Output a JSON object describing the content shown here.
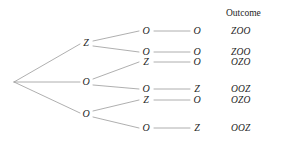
{
  "figure": {
    "type": "probability-tree-diagram",
    "line_color": "#9a9a9a",
    "text_color": "#1e1e1e",
    "background": "#ffffff"
  },
  "header": {
    "outcome_label": "Outcome"
  },
  "root": {
    "label": "",
    "x": 12,
    "y": 82
  },
  "level1": [
    {
      "id": "l1-0",
      "label": "Z",
      "x": 86,
      "y": 43
    },
    {
      "id": "l1-1",
      "label": "O",
      "x": 86,
      "y": 82
    },
    {
      "id": "l1-2",
      "label": "O",
      "x": 86,
      "y": 114
    }
  ],
  "level2": [
    {
      "id": "l2-0",
      "label": "O",
      "x": 146,
      "y": 31,
      "parent": "l1-0"
    },
    {
      "id": "l2-1",
      "label": "O",
      "x": 146,
      "y": 52,
      "parent": "l1-0"
    },
    {
      "id": "l2-2",
      "label": "Z",
      "x": 146,
      "y": 62,
      "parent": "l1-1"
    },
    {
      "id": "l2-3",
      "label": "O",
      "x": 146,
      "y": 89,
      "parent": "l1-1"
    },
    {
      "id": "l2-4",
      "label": "Z",
      "x": 146,
      "y": 100,
      "parent": "l1-2"
    },
    {
      "id": "l2-5",
      "label": "O",
      "x": 146,
      "y": 128,
      "parent": "l1-2"
    }
  ],
  "level3": [
    {
      "id": "l3-0",
      "label": "O",
      "x": 197,
      "y": 31,
      "parent": "l2-0"
    },
    {
      "id": "l3-1",
      "label": "O",
      "x": 197,
      "y": 52,
      "parent": "l2-1"
    },
    {
      "id": "l3-2",
      "label": "O",
      "x": 197,
      "y": 62,
      "parent": "l2-2"
    },
    {
      "id": "l3-3",
      "label": "Z",
      "x": 197,
      "y": 89,
      "parent": "l2-3"
    },
    {
      "id": "l3-4",
      "label": "O",
      "x": 197,
      "y": 100,
      "parent": "l2-4"
    },
    {
      "id": "l3-5",
      "label": "Z",
      "x": 197,
      "y": 128,
      "parent": "l2-5"
    }
  ],
  "outcomes": [
    {
      "id": "out-0",
      "label": "ZOO",
      "x": 231,
      "y": 31
    },
    {
      "id": "out-1",
      "label": "ZOO",
      "x": 231,
      "y": 52
    },
    {
      "id": "out-2",
      "label": "OZO",
      "x": 231,
      "y": 62
    },
    {
      "id": "out-3",
      "label": "OOZ",
      "x": 231,
      "y": 89
    },
    {
      "id": "out-4",
      "label": "OZO",
      "x": 231,
      "y": 100
    },
    {
      "id": "out-5",
      "label": "OOZ",
      "x": 231,
      "y": 128
    }
  ],
  "outcome_header_pos": {
    "x": 226,
    "y": 13
  },
  "edges": [
    {
      "from": [
        14,
        82
      ],
      "to": [
        80,
        44
      ]
    },
    {
      "from": [
        14,
        82
      ],
      "to": [
        80,
        82
      ]
    },
    {
      "from": [
        14,
        82
      ],
      "to": [
        80,
        113
      ]
    },
    {
      "from": [
        93,
        41
      ],
      "to": [
        139,
        31
      ]
    },
    {
      "from": [
        93,
        46
      ],
      "to": [
        139,
        52
      ]
    },
    {
      "from": [
        93,
        79
      ],
      "to": [
        139,
        62
      ]
    },
    {
      "from": [
        93,
        85
      ],
      "to": [
        139,
        89
      ]
    },
    {
      "from": [
        93,
        111
      ],
      "to": [
        139,
        100
      ]
    },
    {
      "from": [
        93,
        117
      ],
      "to": [
        139,
        128
      ]
    },
    {
      "from": [
        154,
        31
      ],
      "to": [
        190,
        31
      ]
    },
    {
      "from": [
        154,
        52
      ],
      "to": [
        190,
        52
      ]
    },
    {
      "from": [
        154,
        62
      ],
      "to": [
        190,
        62
      ]
    },
    {
      "from": [
        154,
        89
      ],
      "to": [
        190,
        89
      ]
    },
    {
      "from": [
        154,
        100
      ],
      "to": [
        190,
        100
      ]
    },
    {
      "from": [
        154,
        128
      ],
      "to": [
        190,
        128
      ]
    }
  ]
}
